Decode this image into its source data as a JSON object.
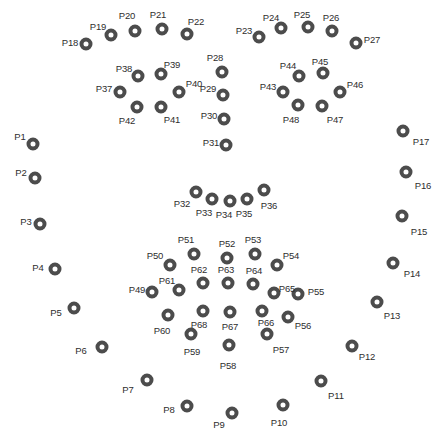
{
  "figure": {
    "type": "electrode-montage-scatter",
    "width": 441,
    "height": 434,
    "background_color": "#ffffff",
    "marker": {
      "shape": "ring",
      "ring_color": "#4c4c4c",
      "fill_color": "#ffffff",
      "outer_diameter_px": 13,
      "stroke_px": 4
    },
    "label_color": "#2e2e2e",
    "label_font_size_px": 9.5
  },
  "chart_data": {
    "type": "scatter",
    "title": "",
    "xlabel": "",
    "ylabel": "",
    "xlim": [
      0,
      441
    ],
    "ylim": [
      434,
      0
    ],
    "grid": false,
    "legend": null,
    "point_count": 68,
    "points": [
      {
        "label": "P1",
        "x": 33,
        "y": 144,
        "lx": 20,
        "ly": 137
      },
      {
        "label": "P2",
        "x": 35,
        "y": 178,
        "lx": 21,
        "ly": 173
      },
      {
        "label": "P3",
        "x": 40,
        "y": 224,
        "lx": 26,
        "ly": 222
      },
      {
        "label": "P4",
        "x": 55,
        "y": 269,
        "lx": 38,
        "ly": 268
      },
      {
        "label": "P5",
        "x": 74,
        "y": 308,
        "lx": 56,
        "ly": 313
      },
      {
        "label": "P6",
        "x": 102,
        "y": 347,
        "lx": 81,
        "ly": 351
      },
      {
        "label": "P7",
        "x": 147,
        "y": 380,
        "lx": 128,
        "ly": 390
      },
      {
        "label": "P8",
        "x": 187,
        "y": 406,
        "lx": 169,
        "ly": 410
      },
      {
        "label": "P9",
        "x": 232,
        "y": 413,
        "lx": 219,
        "ly": 425
      },
      {
        "label": "P10",
        "x": 283,
        "y": 405,
        "lx": 279,
        "ly": 423
      },
      {
        "label": "P11",
        "x": 321,
        "y": 381,
        "lx": 336,
        "ly": 396
      },
      {
        "label": "P12",
        "x": 352,
        "y": 346,
        "lx": 367,
        "ly": 357
      },
      {
        "label": "P13",
        "x": 377,
        "y": 302,
        "lx": 392,
        "ly": 316
      },
      {
        "label": "P14",
        "x": 393,
        "y": 263,
        "lx": 412,
        "ly": 274
      },
      {
        "label": "P15",
        "x": 402,
        "y": 216,
        "lx": 419,
        "ly": 232
      },
      {
        "label": "P16",
        "x": 406,
        "y": 172,
        "lx": 423,
        "ly": 186
      },
      {
        "label": "P17",
        "x": 403,
        "y": 131,
        "lx": 421,
        "ly": 142
      },
      {
        "label": "P18",
        "x": 86,
        "y": 44,
        "lx": 70,
        "ly": 43
      },
      {
        "label": "P19",
        "x": 111,
        "y": 35,
        "lx": 98,
        "ly": 27
      },
      {
        "label": "P20",
        "x": 135,
        "y": 31,
        "lx": 127,
        "ly": 16
      },
      {
        "label": "P21",
        "x": 162,
        "y": 29,
        "lx": 158,
        "ly": 15
      },
      {
        "label": "P22",
        "x": 187,
        "y": 34,
        "lx": 196,
        "ly": 22
      },
      {
        "label": "P23",
        "x": 259,
        "y": 37,
        "lx": 244,
        "ly": 31
      },
      {
        "label": "P24",
        "x": 281,
        "y": 28,
        "lx": 271,
        "ly": 18
      },
      {
        "label": "P25",
        "x": 308,
        "y": 27,
        "lx": 302,
        "ly": 15
      },
      {
        "label": "P26",
        "x": 332,
        "y": 31,
        "lx": 331,
        "ly": 18
      },
      {
        "label": "P27",
        "x": 356,
        "y": 43,
        "lx": 372,
        "ly": 40
      },
      {
        "label": "P28",
        "x": 222,
        "y": 72,
        "lx": 215,
        "ly": 58
      },
      {
        "label": "P29",
        "x": 223,
        "y": 95,
        "lx": 208,
        "ly": 89
      },
      {
        "label": "P30",
        "x": 224,
        "y": 119,
        "lx": 209,
        "ly": 116
      },
      {
        "label": "P31",
        "x": 226,
        "y": 145,
        "lx": 211,
        "ly": 143
      },
      {
        "label": "P32",
        "x": 196,
        "y": 192,
        "lx": 182,
        "ly": 204
      },
      {
        "label": "P33",
        "x": 212,
        "y": 199,
        "lx": 204,
        "ly": 213
      },
      {
        "label": "P34",
        "x": 230,
        "y": 201,
        "lx": 224,
        "ly": 215
      },
      {
        "label": "P35",
        "x": 247,
        "y": 199,
        "lx": 244,
        "ly": 214
      },
      {
        "label": "P36",
        "x": 264,
        "y": 190,
        "lx": 269,
        "ly": 206
      },
      {
        "label": "P37",
        "x": 120,
        "y": 92,
        "lx": 104,
        "ly": 89
      },
      {
        "label": "P38",
        "x": 138,
        "y": 76,
        "lx": 124,
        "ly": 69
      },
      {
        "label": "P39",
        "x": 161,
        "y": 74,
        "lx": 172,
        "ly": 65
      },
      {
        "label": "P40",
        "x": 179,
        "y": 92,
        "lx": 194,
        "ly": 84
      },
      {
        "label": "P41",
        "x": 161,
        "y": 107,
        "lx": 172,
        "ly": 120
      },
      {
        "label": "P42",
        "x": 137,
        "y": 107,
        "lx": 127,
        "ly": 121
      },
      {
        "label": "P43",
        "x": 283,
        "y": 92,
        "lx": 268,
        "ly": 87
      },
      {
        "label": "P44",
        "x": 299,
        "y": 76,
        "lx": 288,
        "ly": 66
      },
      {
        "label": "P45",
        "x": 323,
        "y": 73,
        "lx": 320,
        "ly": 62
      },
      {
        "label": "P46",
        "x": 340,
        "y": 92,
        "lx": 355,
        "ly": 85
      },
      {
        "label": "P47",
        "x": 322,
        "y": 106,
        "lx": 335,
        "ly": 120
      },
      {
        "label": "P48",
        "x": 298,
        "y": 105,
        "lx": 291,
        "ly": 120
      },
      {
        "label": "P49",
        "x": 152,
        "y": 292,
        "lx": 137,
        "ly": 290
      },
      {
        "label": "P50",
        "x": 170,
        "y": 265,
        "lx": 155,
        "ly": 256
      },
      {
        "label": "P51",
        "x": 194,
        "y": 254,
        "lx": 186,
        "ly": 240
      },
      {
        "label": "P52",
        "x": 227,
        "y": 258,
        "lx": 227,
        "ly": 244
      },
      {
        "label": "P53",
        "x": 255,
        "y": 254,
        "lx": 253,
        "ly": 240
      },
      {
        "label": "P54",
        "x": 277,
        "y": 265,
        "lx": 291,
        "ly": 256
      },
      {
        "label": "P55",
        "x": 298,
        "y": 294,
        "lx": 316,
        "ly": 292
      },
      {
        "label": "P56",
        "x": 288,
        "y": 317,
        "lx": 303,
        "ly": 326
      },
      {
        "label": "P57",
        "x": 267,
        "y": 334,
        "lx": 281,
        "ly": 350
      },
      {
        "label": "P58",
        "x": 229,
        "y": 345,
        "lx": 228,
        "ly": 366
      },
      {
        "label": "P59",
        "x": 191,
        "y": 334,
        "lx": 192,
        "ly": 352
      },
      {
        "label": "P60",
        "x": 168,
        "y": 315,
        "lx": 162,
        "ly": 331
      },
      {
        "label": "P61",
        "x": 179,
        "y": 290,
        "lx": 167,
        "ly": 281
      },
      {
        "label": "P62",
        "x": 203,
        "y": 283,
        "lx": 199,
        "ly": 270
      },
      {
        "label": "P63",
        "x": 228,
        "y": 283,
        "lx": 226,
        "ly": 270
      },
      {
        "label": "P64",
        "x": 253,
        "y": 284,
        "lx": 254,
        "ly": 271
      },
      {
        "label": "P65",
        "x": 274,
        "y": 293,
        "lx": 287,
        "ly": 289
      },
      {
        "label": "P66",
        "x": 262,
        "y": 311,
        "lx": 266,
        "ly": 323
      },
      {
        "label": "P67",
        "x": 230,
        "y": 312,
        "lx": 230,
        "ly": 327
      },
      {
        "label": "P68",
        "x": 203,
        "y": 311,
        "lx": 199,
        "ly": 325
      }
    ]
  }
}
